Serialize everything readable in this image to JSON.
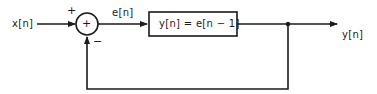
{
  "diagram": {
    "type": "block-diagram",
    "input_label": "x[n]",
    "error_label": "e[n]",
    "output_label": "y[n]",
    "summing_junction": {
      "center_symbol": "+",
      "input_sign": "+",
      "feedback_sign": "−"
    },
    "block": {
      "equation": "y[n] = e[n − 1]"
    },
    "colors": {
      "stroke": "#1a1a1a",
      "background": "#ffffff"
    }
  }
}
